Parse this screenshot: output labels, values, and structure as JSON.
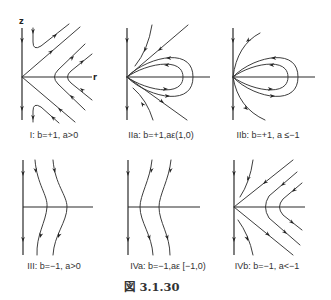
{
  "figure": {
    "label": "図 3.1.30",
    "axis_labels": {
      "vertical": "z",
      "horizontal": "r"
    },
    "panels": [
      {
        "id": "I",
        "caption": "I: b=+1, a>0",
        "phase_portrait": "saddle-like hyperbolic flow, hooks near z-axis"
      },
      {
        "id": "IIa",
        "caption": "IIa: b=+1,aε(1,0)",
        "phase_portrait": "homoclinic loops with straight separatrices"
      },
      {
        "id": "IIb",
        "caption": "IIb: b=+1, a ≤−1",
        "phase_portrait": "homoclinic loops with curved separatrices"
      },
      {
        "id": "III",
        "caption": "III: b=−1, a>0",
        "phase_portrait": "downward trajectories bulging right"
      },
      {
        "id": "IVa",
        "caption": "IVa: b=−1,aε [−1,0)",
        "phase_portrait": "downward trajectories bulging left"
      },
      {
        "id": "IVb",
        "caption": "IVb: b=−1, a<−1",
        "phase_portrait": "hyperbolic flow with separatrices"
      }
    ],
    "colors": {
      "line": "#333333",
      "background": "#ffffff"
    }
  }
}
